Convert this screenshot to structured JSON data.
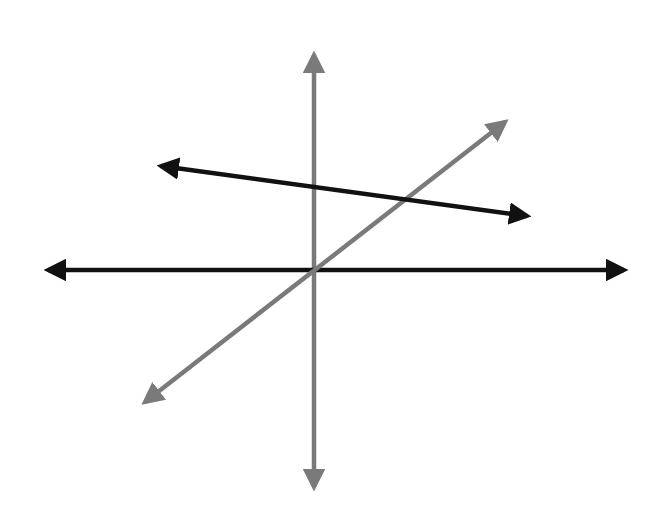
{
  "diagram": {
    "title": "",
    "width": 670,
    "height": 519,
    "background": "#ffffff",
    "colors": {
      "gray": "#7a7a7a",
      "black": "#111111"
    },
    "lines": [
      {
        "id": "vertical-line",
        "color": "#7a7a7a",
        "x1": 314,
        "y1": 47,
        "x2": 314,
        "y2": 495,
        "arrows": "both"
      },
      {
        "id": "horizontal-line",
        "color": "#111111",
        "x1": 40,
        "y1": 270,
        "x2": 632,
        "y2": 270,
        "arrows": "both"
      },
      {
        "id": "diagonal-line",
        "color": "#7a7a7a",
        "x1": 138,
        "y1": 408,
        "x2": 512,
        "y2": 117,
        "arrows": "both"
      },
      {
        "id": "sloped-line",
        "color": "#111111",
        "x1": 153,
        "y1": 165,
        "x2": 535,
        "y2": 217,
        "arrows": "both"
      }
    ]
  }
}
